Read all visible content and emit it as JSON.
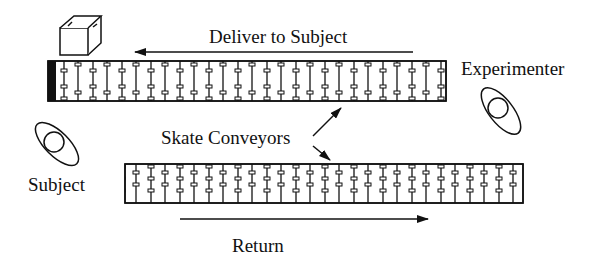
{
  "labels": {
    "deliver": "Deliver to Subject",
    "experimenter": "Experimenter",
    "skate_conveyors": "Skate Conveyors",
    "subject": "Subject",
    "return": "Return"
  },
  "colors": {
    "ink": "#111111",
    "background": "#ffffff"
  },
  "conveyors": [
    {
      "name": "delivery-conveyor",
      "x": 48,
      "y": 61,
      "width": 398,
      "height": 40,
      "direction": "left"
    },
    {
      "name": "return-conveyor",
      "x": 125,
      "y": 164,
      "width": 398,
      "height": 39,
      "direction": "right"
    }
  ]
}
